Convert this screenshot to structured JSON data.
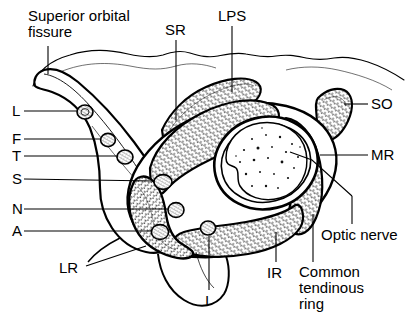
{
  "figure": {
    "ink_color": "#000000",
    "background_color": "#ffffff",
    "hatch_color": "#1a1a1a"
  },
  "labels": {
    "superior_orbital_fissure": "Superior orbital\nfissure",
    "sr": "SR",
    "lps": "LPS",
    "so": "SO",
    "mr": "MR",
    "optic_nerve": "Optic nerve",
    "common_tendinous_ring": "Common\ntendinous\nring",
    "ir": "IR",
    "i": "I",
    "lr": "LR",
    "l": "L",
    "f": "F",
    "t": "T",
    "s": "S",
    "n": "N",
    "a": "A"
  },
  "label_positions": {
    "superior_orbital_fissure": {
      "x": 28,
      "y": 8
    },
    "sr": {
      "x": 165,
      "y": 22
    },
    "lps": {
      "x": 218,
      "y": 8
    },
    "so": {
      "x": 371,
      "y": 96
    },
    "mr": {
      "x": 371,
      "y": 147
    },
    "optic_nerve": {
      "x": 321,
      "y": 227
    },
    "common_tendinous_ring": {
      "x": 299,
      "y": 264
    },
    "ir": {
      "x": 267,
      "y": 265
    },
    "i": {
      "x": 205,
      "y": 293
    },
    "lr": {
      "x": 59,
      "y": 260
    },
    "l": {
      "x": 12,
      "y": 103
    },
    "f": {
      "x": 12,
      "y": 131
    },
    "t": {
      "x": 12,
      "y": 148
    },
    "s": {
      "x": 12,
      "y": 171
    },
    "n": {
      "x": 12,
      "y": 201
    },
    "a": {
      "x": 12,
      "y": 223
    }
  },
  "legend_keys": [
    {
      "key": "SR",
      "meaning": "superior rectus"
    },
    {
      "key": "LPS",
      "meaning": "levator palpebrae superioris"
    },
    {
      "key": "SO",
      "meaning": "superior oblique"
    },
    {
      "key": "MR",
      "meaning": "medial rectus"
    },
    {
      "key": "IR",
      "meaning": "inferior rectus"
    },
    {
      "key": "I",
      "meaning": "inferior oblique nerve"
    },
    {
      "key": "LR",
      "meaning": "lateral rectus"
    },
    {
      "key": "L",
      "meaning": "lacrimal nerve"
    },
    {
      "key": "F",
      "meaning": "frontal nerve"
    },
    {
      "key": "T",
      "meaning": "trochlear nerve"
    },
    {
      "key": "S",
      "meaning": "superior division of oculomotor nerve"
    },
    {
      "key": "N",
      "meaning": "nasociliary nerve"
    },
    {
      "key": "A",
      "meaning": "abducens nerve"
    }
  ],
  "nerve_markers": [
    {
      "key": "L",
      "cx": 85,
      "cy": 112,
      "rx": 8,
      "ry": 7
    },
    {
      "key": "F",
      "cx": 108,
      "cy": 140,
      "rx": 7,
      "ry": 6.5
    },
    {
      "key": "T",
      "cx": 125,
      "cy": 157,
      "rx": 8,
      "ry": 7
    },
    {
      "key": "S",
      "cx": 163,
      "cy": 182,
      "rx": 9,
      "ry": 7.5
    },
    {
      "key": "N",
      "cx": 176,
      "cy": 210,
      "rx": 8,
      "ry": 7.5
    },
    {
      "key": "A",
      "cx": 160,
      "cy": 232,
      "rx": 8.5,
      "ry": 7.5
    },
    {
      "key": "I",
      "cx": 208,
      "cy": 228,
      "rx": 7.5,
      "ry": 7
    }
  ]
}
